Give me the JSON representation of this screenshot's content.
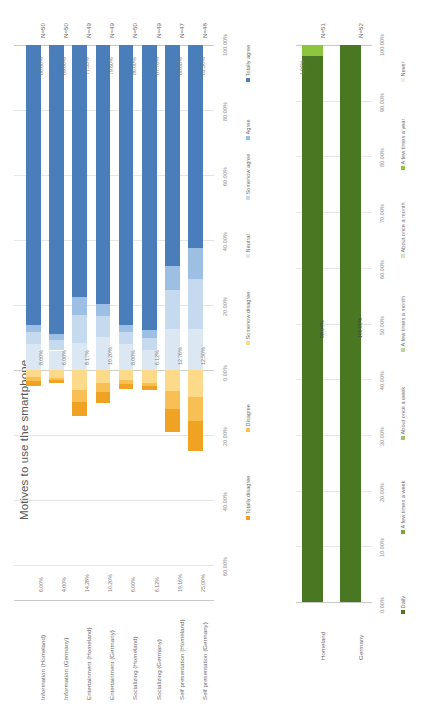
{
  "page": {
    "orientation": "rotated-90-clockwise",
    "background": "#ffffff"
  },
  "charts": [
    {
      "id": "motives",
      "title": "Motives to use the smartphone",
      "position": "left",
      "chart_data": {
        "type": "bar",
        "subtype": "diverging-stacked-horizontal",
        "title": "Motives to use the smartphone",
        "xlabel": "",
        "ylabel": "",
        "grid": true,
        "legend_position": "bottom",
        "xlim": [
          -60,
          100
        ],
        "axis_ticks": [
          "60.00%",
          "40.00%",
          "20.00%",
          "0.00%",
          "20.00%",
          "40.00%",
          "60.00%",
          "80.00%",
          "100.00%"
        ],
        "axis_tick_values": [
          -60,
          -40,
          -20,
          0,
          20,
          40,
          60,
          80,
          100
        ],
        "categories": [
          "Information (Homeland)",
          "Information (Germany)",
          "Entertainment (Homeland)",
          "Entertainment (Germany)",
          "Socializing (Homeland)",
          "Socializing (Germany)",
          "Self presentation (Homeland)",
          "Self presentation (Germany)"
        ],
        "sample_sizes": [
          "N=50",
          "N=50",
          "N=49",
          "N=49",
          "N=50",
          "N=49",
          "N=47",
          "N=48"
        ],
        "series": [
          {
            "name": "Totally disagree",
            "color": "#f0a222",
            "values": [
              -3.0,
              -1.5,
              -8.16,
              -6.12,
              -3.0,
              -2.04,
              -12.76,
              -16.66
            ],
            "labels": [
              "6.00%",
              "4.00%",
              "14.28%",
              "10.20%",
              "6.00%",
              "6.12%",
              "19.16%",
              "25.00%"
            ]
          },
          {
            "name": "Disagree",
            "color": "#f8b githubfallback",
            "values": [],
            "labels": []
          },
          {
            "name": "Somehow disagree",
            "color": "#fdd98a",
            "values": [
              -2.0,
              -2.5,
              -6.12,
              -4.08,
              -3.0,
              -4.08,
              -6.4,
              -8.34
            ],
            "labels": []
          },
          {
            "name": "Neutral",
            "color": "#dce7f4",
            "values": [
              8.0,
              6.0,
              8.17,
              10.2,
              8.0,
              6.12,
              12.76,
              12.5
            ],
            "labels": [
              "8.00%",
              "6.00%",
              "8.17%",
              "10.20%",
              "8.00%",
              "6.12%",
              "12.76%",
              "12.50%"
            ]
          },
          {
            "name": "Somehow agree",
            "color": "#c5d9ef",
            "values": [],
            "labels": []
          },
          {
            "name": "Agree",
            "color": "#9dbfe3",
            "values": [],
            "labels": []
          },
          {
            "name": "Totally agree",
            "color": "#4a7ebb",
            "values": [
              86.0,
              89.0,
              77.55,
              79.6,
              86.0,
              87.76,
              68.08,
              62.5
            ],
            "labels": [
              "86.00%",
              "89.00%",
              "77.55%",
              "79.60%",
              "86.00%",
              "87.76%",
              "68.08%",
              "62.50%"
            ]
          }
        ],
        "legend": [
          {
            "label": "Totally disagree",
            "color": "#f0a222"
          },
          {
            "label": "Disagree",
            "color": "#f8bf55"
          },
          {
            "label": "Somehow disagree",
            "color": "#fdd98a"
          },
          {
            "label": "Neutral",
            "color": "#dce7f4"
          },
          {
            "label": "Somehow agree",
            "color": "#c5d9ef"
          },
          {
            "label": "Agree",
            "color": "#9dbfe3"
          },
          {
            "label": "Totally agree",
            "color": "#4a7ebb"
          }
        ]
      }
    },
    {
      "id": "using",
      "title": "Using the smartphone",
      "position": "right",
      "chart_data": {
        "type": "bar",
        "subtype": "stacked-horizontal-100",
        "title": "Using the smartphone",
        "xlabel": "",
        "ylabel": "",
        "grid": true,
        "legend_position": "bottom",
        "xlim": [
          0,
          100
        ],
        "axis_ticks": [
          "0.00%",
          "10.00%",
          "20.00%",
          "30.00%",
          "40.00%",
          "50.00%",
          "60.00%",
          "70.00%",
          "80.00%",
          "90.00%",
          "100.00%"
        ],
        "axis_tick_values": [
          0,
          10,
          20,
          30,
          40,
          50,
          60,
          70,
          80,
          90,
          100
        ],
        "categories": [
          "Homeland",
          "Germany"
        ],
        "sample_sizes": [
          "N=51",
          "N=52"
        ],
        "series": [
          {
            "name": "Daily",
            "color": "#4a7722",
            "values": [
              98.04,
              100.0
            ],
            "labels": [
              "98.04%",
              "100.00%"
            ]
          },
          {
            "name": "A few times a week",
            "color": "#76a63c",
            "values": [
              0,
              0
            ],
            "labels": []
          },
          {
            "name": "About once a week",
            "color": "#9ec46a",
            "values": [
              0,
              0
            ],
            "labels": []
          },
          {
            "name": "A few times a month",
            "color": "#bcd79a",
            "values": [
              0,
              0
            ],
            "labels": []
          },
          {
            "name": "About once a month",
            "color": "#d4e5bd",
            "values": [
              0,
              0
            ],
            "labels": []
          },
          {
            "name": "A few times a year",
            "color": "#8cc63f",
            "values": [
              1.96,
              0.0
            ],
            "labels": [
              "1.96%",
              ""
            ]
          },
          {
            "name": "Never",
            "color": "#e8f1dc",
            "values": [
              0,
              0
            ],
            "labels": []
          }
        ],
        "legend": [
          {
            "label": "Daily",
            "color": "#4a7722"
          },
          {
            "label": "A few times a week",
            "color": "#76a63c"
          },
          {
            "label": "About once a week",
            "color": "#9ec46a"
          },
          {
            "label": "A few times a month",
            "color": "#bcd79a"
          },
          {
            "label": "About once a month",
            "color": "#d4e5bd"
          },
          {
            "label": "A few times a year",
            "color": "#8cc63f"
          },
          {
            "label": "Never",
            "color": "#e8f1dc"
          }
        ]
      }
    }
  ]
}
